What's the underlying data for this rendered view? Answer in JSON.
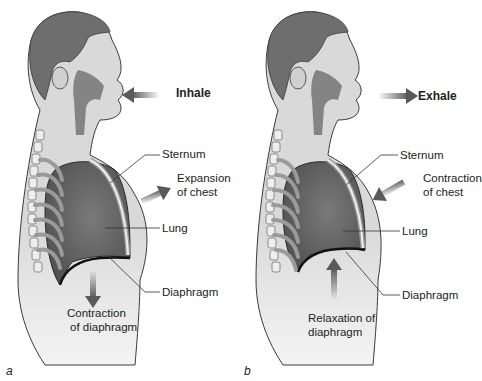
{
  "figure": {
    "panels": [
      {
        "letter": "a",
        "breath_label": "Inhale",
        "breath_direction": "in",
        "labels": {
          "sternum": "Sternum",
          "chest_action": "Expansion\nof chest",
          "chest_line1": "Expansion",
          "chest_line2": "of chest",
          "lung": "Lung",
          "diaphragm": "Diaphragm",
          "diaphragm_line1": "Contraction",
          "diaphragm_line2": "of diaphragm"
        }
      },
      {
        "letter": "b",
        "breath_label": "Exhale",
        "breath_direction": "out",
        "labels": {
          "sternum": "Sternum",
          "chest_line1": "Contraction",
          "chest_line2": "of chest",
          "lung": "Lung",
          "diaphragm": "Diaphragm",
          "diaphragm_line1": "Relaxation of",
          "diaphragm_line2": "diaphragm"
        }
      }
    ],
    "colors": {
      "hair": "#6e6e6e",
      "skin": "#d9d9d9",
      "lung": "#6a6a6a",
      "airway": "#7a7a7a",
      "arrow": "#5a5a5a",
      "outline": "#3a3a3a",
      "text": "#222222"
    }
  }
}
